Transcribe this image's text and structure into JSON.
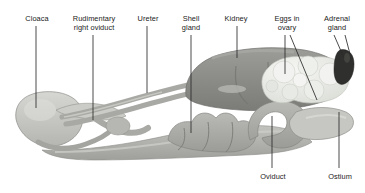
{
  "figure": {
    "background": "#ffffff",
    "leader_color": "#2a2a2a",
    "text_color": "#1b1b1b"
  },
  "palette": {
    "cloaca": "#c9c9c6",
    "oviduct_tube": "#b0b1ad",
    "oviduct_mid": "#a3a49f",
    "kidney": "#8e8f8b",
    "kidney_dark": "#7c7d79",
    "ovary_eggs": "#eceee9",
    "egg_shadow": "#d6d8d2",
    "adrenal": "#2f2f2d",
    "ostium": "#c2c3bf",
    "outline": "#8a8b86"
  },
  "labels": [
    {
      "id": "cloaca",
      "text": "Cloaca",
      "x": 14,
      "y": 14,
      "w": 46,
      "lines": 1
    },
    {
      "id": "rudimentary-right-oviduct",
      "text": "Rudimentary\nright oviduct",
      "x": 57,
      "y": 14,
      "w": 74,
      "lines": 2
    },
    {
      "id": "ureter",
      "text": "Ureter",
      "x": 126,
      "y": 14,
      "w": 44,
      "lines": 1
    },
    {
      "id": "shell-gland",
      "text": "Shell\ngland",
      "x": 172,
      "y": 14,
      "w": 38,
      "lines": 2
    },
    {
      "id": "kidney",
      "text": "Kidney",
      "x": 214,
      "y": 14,
      "w": 44,
      "lines": 1
    },
    {
      "id": "eggs-in-ovary",
      "text": "Eggs in\novary",
      "x": 265,
      "y": 14,
      "w": 44,
      "lines": 2
    },
    {
      "id": "adrenal-gland",
      "text": "Adrenal\ngland",
      "x": 314,
      "y": 14,
      "w": 46,
      "lines": 2
    },
    {
      "id": "oviduct",
      "text": "Oviduct",
      "x": 250,
      "y": 172,
      "w": 46,
      "lines": 1
    },
    {
      "id": "ostium",
      "text": "Ostium",
      "x": 318,
      "y": 172,
      "w": 44,
      "lines": 1
    }
  ],
  "structures": [
    {
      "id": "cloaca",
      "name": "cloaca"
    },
    {
      "id": "vagina-tube",
      "name": "vagina / lower oviduct tube"
    },
    {
      "id": "rudimentary-right-oviduct",
      "name": "rudimentary right oviduct"
    },
    {
      "id": "ureter",
      "name": "ureter"
    },
    {
      "id": "shell-gland",
      "name": "shell gland (uterus)"
    },
    {
      "id": "kidney",
      "name": "kidney"
    },
    {
      "id": "oviduct",
      "name": "oviduct (magnum / isthmus coils)"
    },
    {
      "id": "ovary-eggs",
      "name": "eggs in ovary (follicles)"
    },
    {
      "id": "adrenal-gland",
      "name": "adrenal gland"
    },
    {
      "id": "ostium",
      "name": "ostium (infundibulum)"
    }
  ]
}
